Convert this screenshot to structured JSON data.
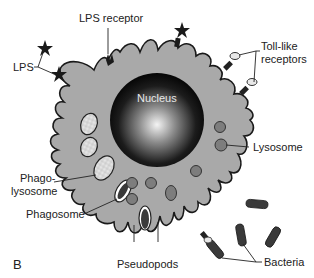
{
  "figure": {
    "panel_label": "B",
    "labels": {
      "lps_receptor": "LPS receptor",
      "lps": "LPS",
      "toll_like_receptors_line1": "Toll-like",
      "toll_like_receptors_line2": "receptors",
      "nucleus": "Nucleus",
      "lysosome": "Lysosome",
      "phagolysosome_line1": "Phago-",
      "phagolysosome_line2": "lysosome",
      "phagosome": "Phagosome",
      "pseudopods": "Pseudopods",
      "bacteria": "Bacteria"
    },
    "colors": {
      "cytoplasm": "#a9a9a9",
      "outline": "#1a1a1a",
      "nucleus_dark": "#0a0a0a",
      "nucleus_light": "#f2f2f2",
      "lysosome": "#7d7d7d",
      "bacteria": "#3a3a3a"
    }
  }
}
